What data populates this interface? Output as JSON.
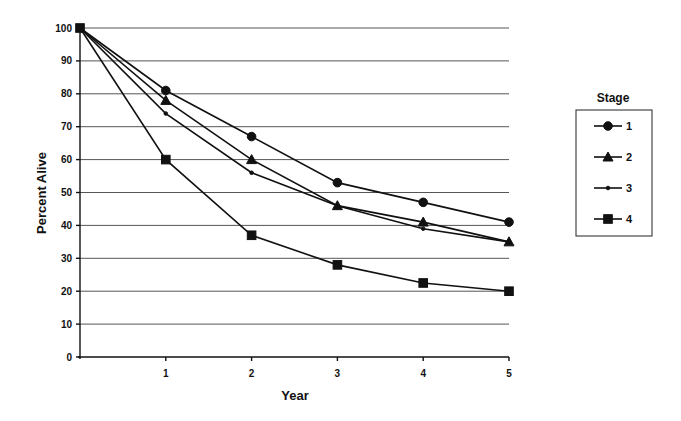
{
  "chart_data": {
    "type": "line",
    "title": "",
    "xlabel": "Year",
    "ylabel": "Percent Alive",
    "x": [
      0,
      1,
      2,
      3,
      4,
      5
    ],
    "x_tick_labels": [
      "1",
      "2",
      "3",
      "4",
      "5"
    ],
    "y_tick_labels": [
      "0",
      "10",
      "20",
      "30",
      "40",
      "50",
      "60",
      "70",
      "80",
      "90",
      "100"
    ],
    "ylim": [
      0,
      100
    ],
    "xlim": [
      0,
      5
    ],
    "grid": true,
    "legend": {
      "title": "Stage",
      "position": "right"
    },
    "series": [
      {
        "name": "1",
        "marker": "circle",
        "values": [
          100,
          81,
          67,
          53,
          47,
          41
        ]
      },
      {
        "name": "2",
        "marker": "triangle",
        "values": [
          100,
          78,
          60,
          46,
          41,
          35
        ]
      },
      {
        "name": "3",
        "marker": "dot",
        "values": [
          100,
          74,
          56,
          46,
          39,
          35
        ]
      },
      {
        "name": "4",
        "marker": "square",
        "values": [
          100,
          60,
          37,
          28,
          22.5,
          20
        ]
      }
    ]
  }
}
